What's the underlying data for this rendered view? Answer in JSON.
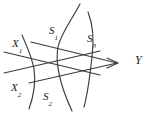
{
  "figure": {
    "background_color": "#ffffff",
    "stroke_color": "#3a3a3a",
    "label_color": "#1a1a1a",
    "width": 160,
    "height": 114,
    "labels": [
      {
        "id": "x1",
        "base": "X",
        "sub": "1",
        "x": 12,
        "y": 34
      },
      {
        "id": "x2",
        "base": "X",
        "sub": "2",
        "x": 11,
        "y": 78
      },
      {
        "id": "s1",
        "base": "S",
        "sub": "1",
        "x": 49,
        "y": 21
      },
      {
        "id": "s2",
        "base": "S",
        "sub": "2",
        "x": 43,
        "y": 87
      },
      {
        "id": "s3",
        "base": "S",
        "sub": "3",
        "x": 87,
        "y": 29
      },
      {
        "id": "y",
        "base": "Y",
        "sub": "",
        "x": 135,
        "y": 51
      }
    ],
    "geometry": {
      "arrow_tip": {
        "x": 117,
        "y": 63
      },
      "upper_line": {
        "x1": 31,
        "y1": 42,
        "x2": 117,
        "y2": 63
      },
      "lower_line": {
        "x1": 29,
        "y1": 83,
        "x2": 117,
        "y2": 63
      },
      "upper_tail": {
        "x1": 5,
        "y1": 72,
        "x2": 93,
        "y2": 52
      },
      "lower_tail": {
        "x1": 5,
        "y1": 52,
        "x2": 93,
        "y2": 74
      },
      "curve_s1": "M 80 4 C 70 22, 60 34, 57 48 C 54 64, 60 84, 72 111",
      "curve_s2": "M 22 36 C 27 48, 32 58, 34 70 C 36 82, 34 94, 29 108",
      "curve_s3": "M 88 12 C 94 26, 94 40, 92 56 C 90 74, 88 92, 84 107"
    },
    "curve_semantics": [
      {
        "id": "s1",
        "label": "S1",
        "role": "surface-curve"
      },
      {
        "id": "s2",
        "label": "S2",
        "role": "surface-curve"
      },
      {
        "id": "s3",
        "label": "S3",
        "role": "surface-curve"
      }
    ]
  }
}
